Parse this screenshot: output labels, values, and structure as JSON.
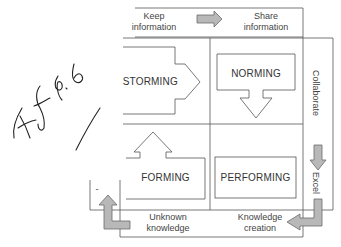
{
  "diagram": {
    "top": {
      "left_label": "Keep\ninformation",
      "right_label": "Share\ninformation"
    },
    "right": {
      "top_label": "Collaborate",
      "bottom_label": "Excel"
    },
    "bottom": {
      "left_label": "Unknown\nknowledge",
      "right_label": "Knowledge\ncreation"
    },
    "stages": {
      "top_left": "STORMING",
      "top_right": "NORMING",
      "bottom_left": "FORMING",
      "bottom_right": "PERFORMING"
    },
    "left_partial_label": "-",
    "annotation": "handwritten signature",
    "colors": {
      "line": "#555555",
      "arrow_fill": "#b8b8b8",
      "arrow_stroke": "#6a6a6a",
      "ink": "#222222"
    }
  }
}
